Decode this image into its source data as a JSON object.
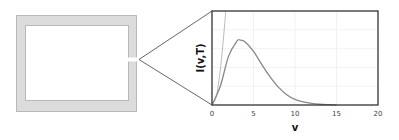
{
  "diagram": {
    "cavity": {
      "description": "blackbody cavity with small opening",
      "wall_color": "#dcdcdc",
      "wall_border_color": "#b8b8b8",
      "interior_color": "#ffffff"
    },
    "zoom_lines_color": "#555555"
  },
  "chart_data": {
    "type": "line",
    "title": "",
    "xlabel": "v",
    "ylabel": "I(v,T)",
    "xlim": [
      0,
      20
    ],
    "ylim": [
      0,
      1
    ],
    "x_ticks": [
      "0",
      "5",
      "10",
      "15",
      "20"
    ],
    "grid": true,
    "legend": null,
    "series": [
      {
        "name": "Planck spectrum",
        "color": "#888888",
        "x": [
          0,
          1,
          2,
          3,
          3.4,
          4,
          5,
          6,
          7,
          8,
          9,
          10,
          11,
          12,
          13,
          14,
          15
        ],
        "y": [
          0,
          0.2,
          0.52,
          0.68,
          0.69,
          0.67,
          0.57,
          0.43,
          0.3,
          0.19,
          0.11,
          0.06,
          0.033,
          0.017,
          0.008,
          0.004,
          0.002
        ]
      },
      {
        "name": "Rayleigh-Jeans approximation",
        "color": "#bbbbbb",
        "x": [
          0,
          0.5,
          1,
          1.5,
          1.65
        ],
        "y": [
          0,
          0.09,
          0.37,
          0.83,
          1.0
        ]
      }
    ]
  }
}
